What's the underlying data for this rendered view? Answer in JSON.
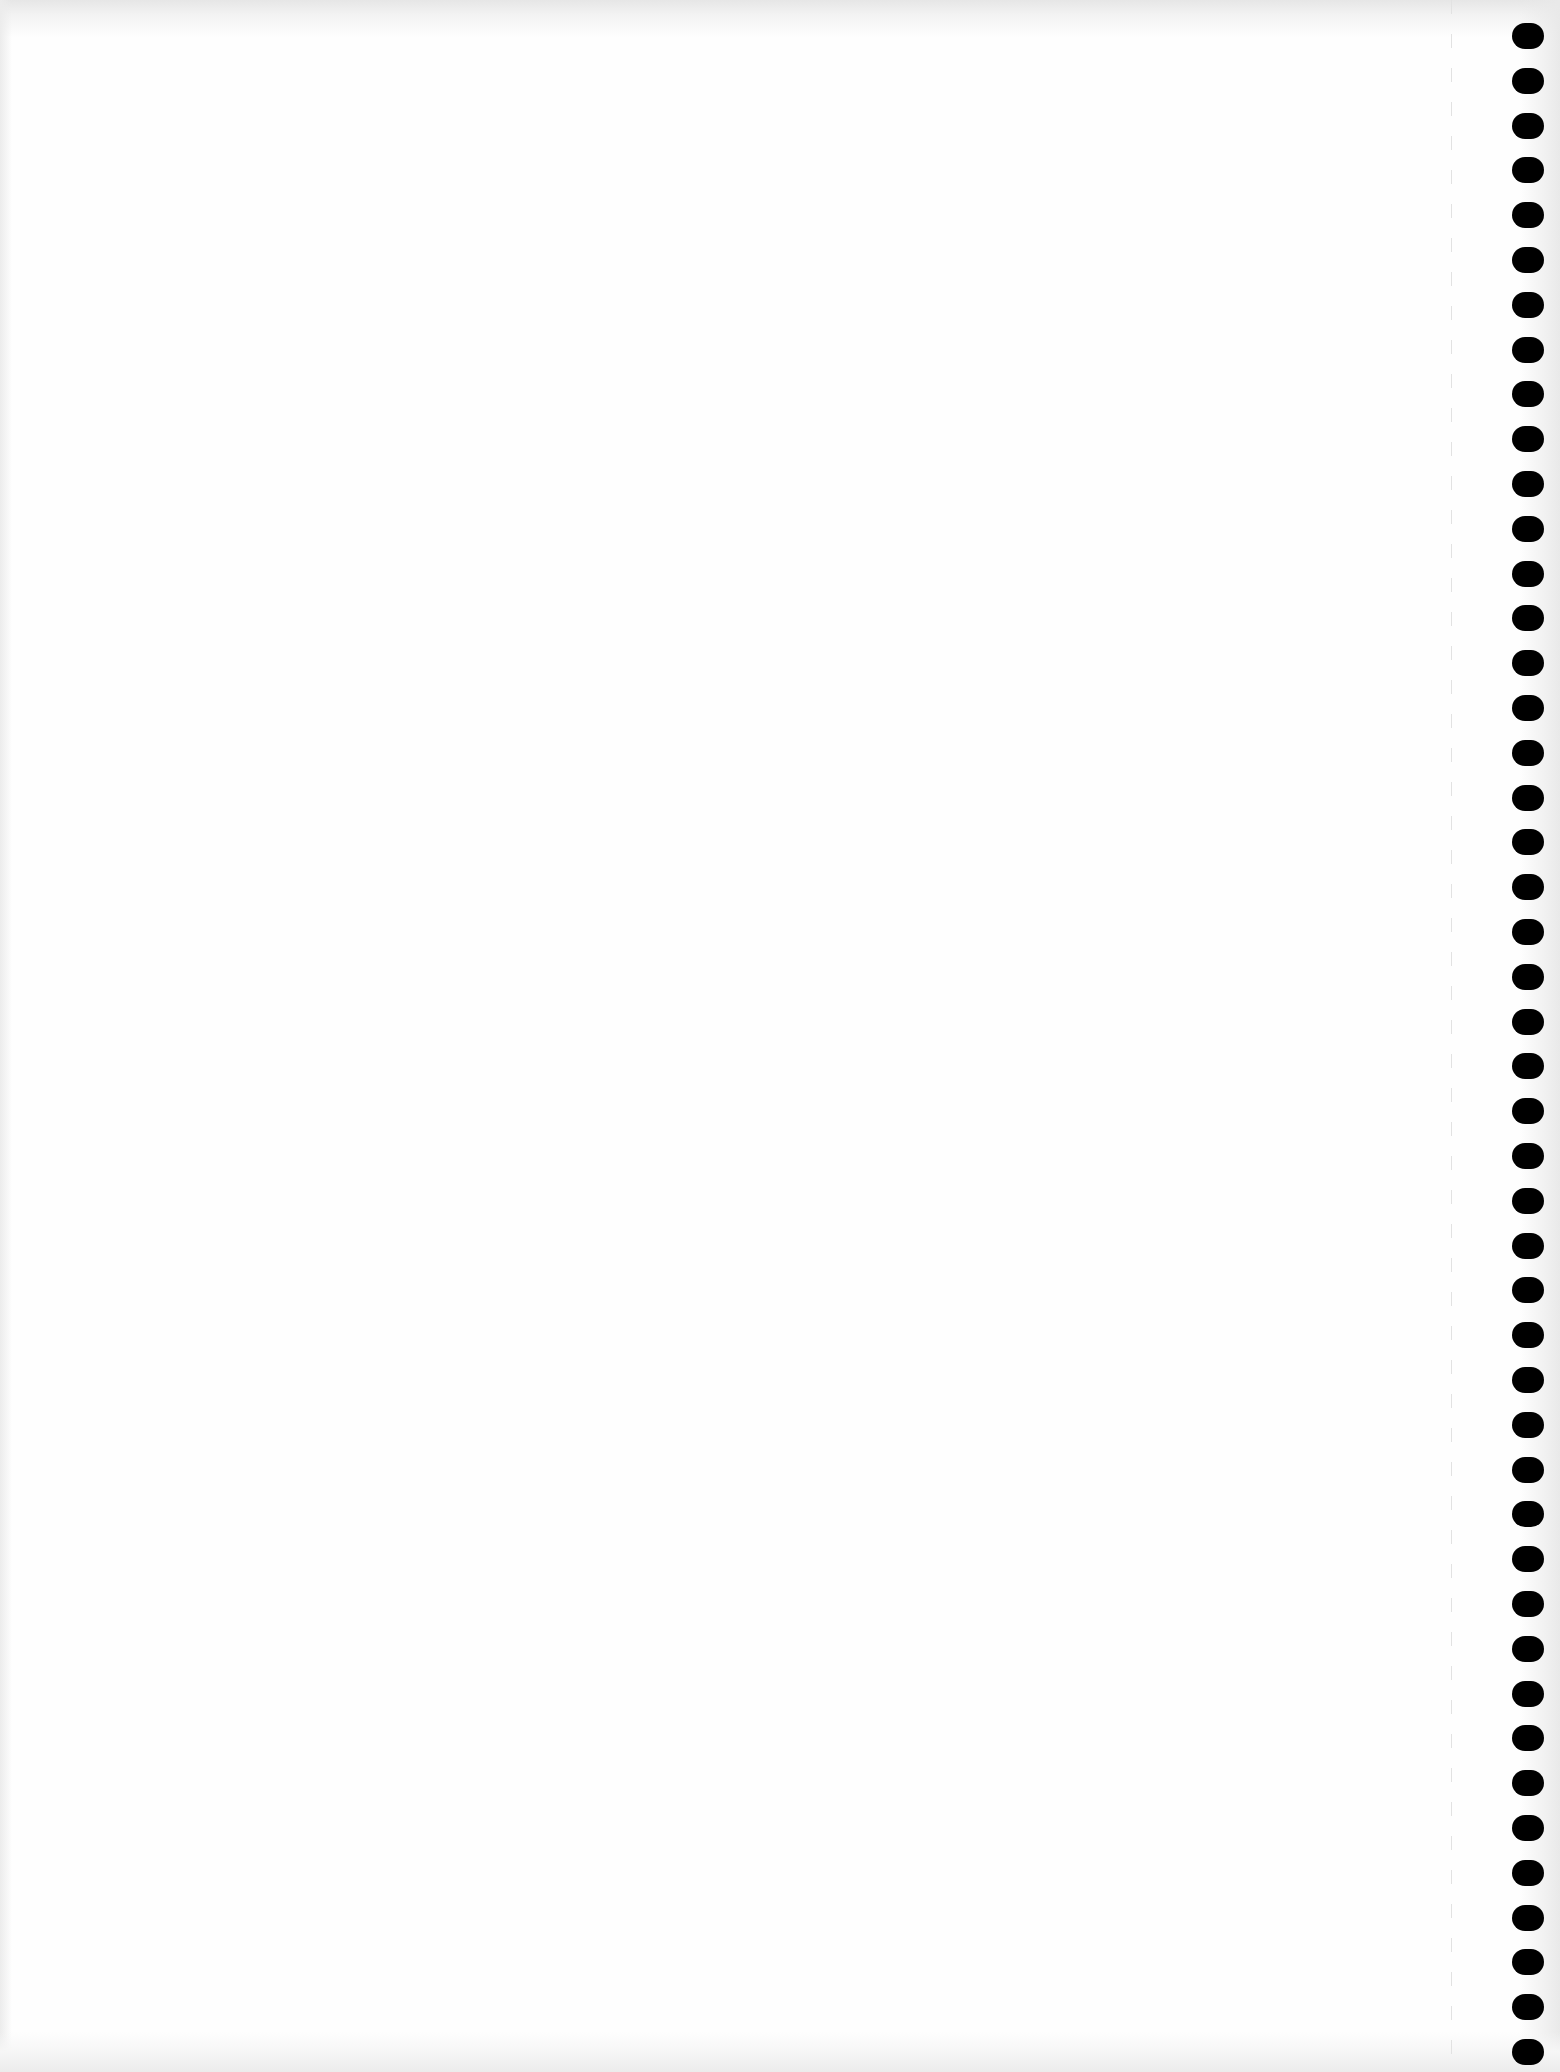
{
  "page": {
    "type": "blank-notebook-sheet",
    "background_color": "#fefefe",
    "content_text": ""
  },
  "binding": {
    "icon": "spiral-binding-hole-icon",
    "side": "right",
    "hole_count": 46,
    "hole_color": "#000000",
    "first_hole_center_y": 36,
    "spacing_px": 44.8
  },
  "perforation": {
    "icon": "perforation-line",
    "x": 1451,
    "color": "#e2e2e2"
  }
}
